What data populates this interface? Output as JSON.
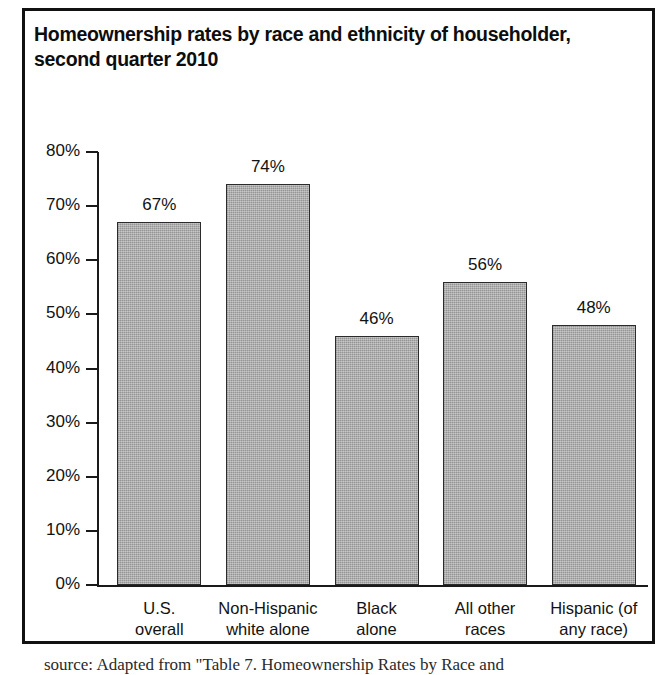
{
  "figure": {
    "title_line1": "Homeownership rates by race and ethnicity of householder,",
    "title_line2": "second quarter 2010",
    "source_note": "source: Adapted from \"Table 7. Homeownership Rates by Race and"
  },
  "chart_data": {
    "type": "bar",
    "title": "Homeownership rates by race and ethnicity of householder, second quarter 2010",
    "xlabel": "",
    "ylabel": "",
    "categories": [
      "U.S. overall",
      "Non-Hispanic white alone",
      "Black alone",
      "All other races",
      "Hispanic (of any race)"
    ],
    "category_lines": [
      [
        "U.S.",
        "overall"
      ],
      [
        "Non-Hispanic",
        "white alone"
      ],
      [
        "Black",
        "alone"
      ],
      [
        "All other",
        "races"
      ],
      [
        "Hispanic (of",
        "any race)"
      ]
    ],
    "values": [
      67,
      74,
      46,
      56,
      48
    ],
    "value_labels": [
      "67%",
      "74%",
      "46%",
      "56%",
      "48%"
    ],
    "ylim": [
      0,
      80
    ],
    "ytick_values": [
      0,
      10,
      20,
      30,
      40,
      50,
      60,
      70,
      80
    ],
    "ytick_labels": [
      "0%",
      "10%",
      "20%",
      "30%",
      "40%",
      "50%",
      "60%",
      "70%",
      "80%"
    ],
    "grid": false,
    "legend": false,
    "bar_color": "#a5a5a5",
    "bar_edge_color": "#2b2b2b",
    "axis_color": "#1a1a1a",
    "background": "#ffffff"
  }
}
